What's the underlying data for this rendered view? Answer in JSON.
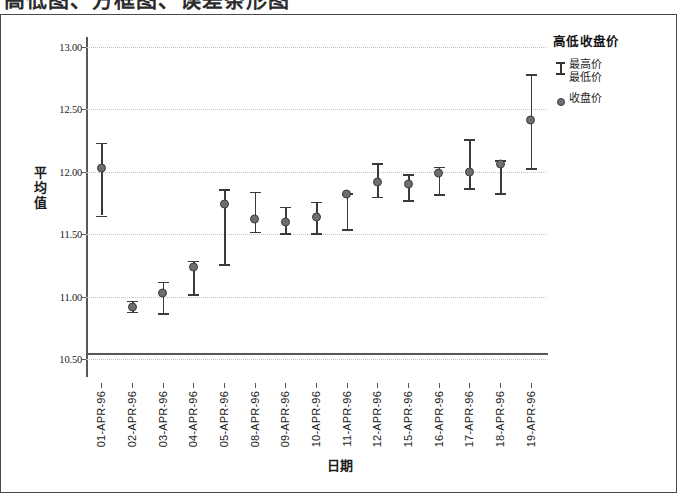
{
  "heading": {
    "clipped_text": "高低图、方框图、误差条形图"
  },
  "legend": {
    "title": "高低收盘价",
    "entries": [
      {
        "symbol": "i-bar-icon",
        "lines": [
          "最高价",
          "最低价"
        ]
      },
      {
        "symbol": "dot-icon",
        "lines": [
          "收盘价"
        ]
      }
    ]
  },
  "axes": {
    "y_title": "平均值",
    "x_title": "日期"
  },
  "chart_data": {
    "type": "line",
    "chart_subtype": "high-low-close",
    "title": "",
    "xlabel": "日期",
    "ylabel": "平均值",
    "ylim": [
      10.36,
      13.06
    ],
    "yticks": [
      "10.50",
      "11.00",
      "11.50",
      "12.00",
      "12.50",
      "13.00"
    ],
    "ytick_values": [
      10.5,
      11.0,
      11.5,
      12.0,
      12.5,
      13.0
    ],
    "grid": true,
    "legend_position": "right-top",
    "categories": [
      "01-APR-96",
      "02-APR-96",
      "03-APR-96",
      "04-APR-96",
      "05-APR-96",
      "08-APR-96",
      "09-APR-96",
      "10-APR-96",
      "11-APR-96",
      "12-APR-96",
      "15-APR-96",
      "16-APR-96",
      "17-APR-96",
      "18-APR-96",
      "19-APR-96"
    ],
    "series": [
      {
        "name": "最高价",
        "values": [
          12.23,
          10.97,
          11.12,
          11.29,
          11.86,
          11.84,
          11.72,
          11.76,
          11.83,
          12.07,
          11.98,
          12.04,
          12.26,
          12.09,
          12.78
        ]
      },
      {
        "name": "最低价",
        "values": [
          11.65,
          10.88,
          10.87,
          11.02,
          11.26,
          11.52,
          11.51,
          11.51,
          11.54,
          11.8,
          11.77,
          11.82,
          11.87,
          11.83,
          12.03
        ]
      },
      {
        "name": "收盘价",
        "values": [
          12.03,
          10.92,
          11.03,
          11.24,
          11.74,
          11.62,
          11.6,
          11.64,
          11.82,
          11.92,
          11.9,
          11.99,
          12.0,
          12.06,
          12.41
        ]
      }
    ]
  }
}
